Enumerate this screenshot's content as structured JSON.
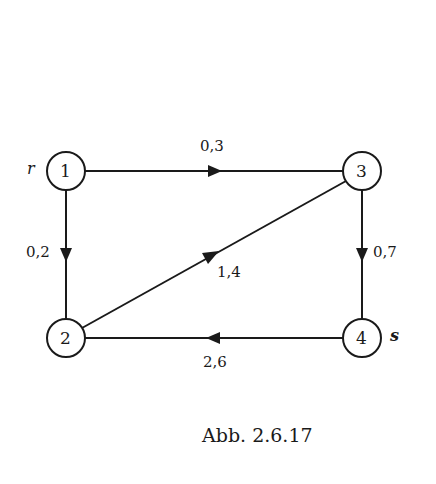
{
  "diagram": {
    "type": "directed-graph",
    "nodes": [
      {
        "id": "1",
        "label": "1",
        "x": 66,
        "y": 171,
        "tag": "r"
      },
      {
        "id": "2",
        "label": "2",
        "x": 66,
        "y": 338,
        "tag": ""
      },
      {
        "id": "3",
        "label": "3",
        "x": 362,
        "y": 171,
        "tag": ""
      },
      {
        "id": "4",
        "label": "4",
        "x": 362,
        "y": 338,
        "tag": "s"
      }
    ],
    "edges": [
      {
        "from": "1",
        "to": "3",
        "weight": "0,3"
      },
      {
        "from": "1",
        "to": "2",
        "weight": "0,2"
      },
      {
        "from": "2",
        "to": "3",
        "weight": "1,4"
      },
      {
        "from": "3",
        "to": "4",
        "weight": "0,7"
      },
      {
        "from": "4",
        "to": "2",
        "weight": "2,6"
      }
    ],
    "source_label": "r",
    "sink_label": "s",
    "caption": "Abb. 2.6.17"
  },
  "labels": {
    "node1": "1",
    "node2": "2",
    "node3": "3",
    "node4": "4",
    "r": "r",
    "s": "s",
    "e13": "0,3",
    "e12": "0,2",
    "e23": "1,4",
    "e34": "0,7",
    "e42": "2,6"
  },
  "colors": {
    "stroke": "#1a1a1a",
    "background": "#ffffff"
  }
}
